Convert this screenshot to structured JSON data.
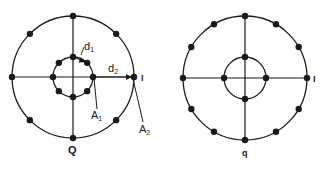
{
  "diagrams": [
    {
      "id": "left",
      "center": [
        73,
        77
      ],
      "outer_radius": 61,
      "inner_radius": 20,
      "outer_points": 8,
      "inner_points": 8,
      "labels": {
        "i_axis": "I",
        "q_axis": "Q",
        "d1": "d",
        "d1_sub": "1",
        "d2": "d",
        "d2_sub": "2",
        "a1": "A",
        "a1_sub": "1",
        "a2": "A",
        "a2_sub": "2"
      }
    },
    {
      "id": "right",
      "center": [
        245,
        78
      ],
      "outer_radius": 62,
      "inner_radius": 21,
      "outer_points": 12,
      "inner_points": 4,
      "labels": {
        "i_axis": "I",
        "q_axis": "q"
      }
    }
  ],
  "colors": {
    "ink": "#1a1a1a",
    "background": "#ffffff"
  }
}
